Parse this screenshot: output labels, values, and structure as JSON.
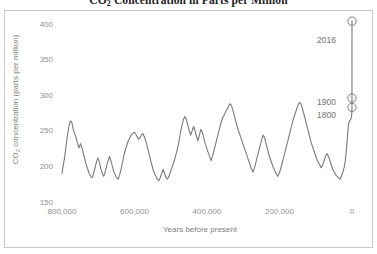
{
  "chart_data": {
    "type": "line",
    "title": "CO2 Concentration in Parts per Million",
    "title_main": "CO",
    "title_sub": "2",
    "title_rest": " Concentration in Parts per Million",
    "xlabel": "Years before present",
    "ylabel_main": "CO",
    "ylabel_sub": "2",
    "ylabel_rest": " concentration (parts per million)",
    "ylabel": "CO2 concentration (parts per million)",
    "xlim": [
      800000,
      0
    ],
    "ylim": [
      150,
      400
    ],
    "x_ticks": [
      "800,000",
      "600,000",
      "400,000",
      "200,000",
      "0"
    ],
    "x_tick_values": [
      800000,
      600000,
      400000,
      200000,
      0
    ],
    "y_ticks": [
      "150",
      "200",
      "250",
      "300",
      "350",
      "400"
    ],
    "y_tick_values": [
      150,
      200,
      250,
      300,
      350,
      400
    ],
    "grid": false,
    "legend": "none",
    "line_color": "#7a7a7a",
    "series": [
      {
        "name": "Ice core CO2 record",
        "x": [
          800000,
          797000,
          793000,
          789000,
          785000,
          781000,
          777000,
          773000,
          769000,
          765000,
          761000,
          757000,
          753000,
          749000,
          745000,
          741000,
          737000,
          733000,
          729000,
          725000,
          721000,
          717000,
          713000,
          709000,
          705000,
          701000,
          697000,
          693000,
          689000,
          685000,
          681000,
          677000,
          673000,
          669000,
          665000,
          661000,
          657000,
          653000,
          649000,
          645000,
          641000,
          637000,
          633000,
          629000,
          625000,
          621000,
          617000,
          613000,
          609000,
          605000,
          601000,
          597000,
          593000,
          589000,
          585000,
          581000,
          577000,
          573000,
          569000,
          565000,
          561000,
          557000,
          553000,
          549000,
          545000,
          541000,
          537000,
          533000,
          529000,
          525000,
          521000,
          517000,
          513000,
          509000,
          505000,
          501000,
          497000,
          493000,
          489000,
          485000,
          481000,
          477000,
          473000,
          469000,
          465000,
          461000,
          457000,
          453000,
          449000,
          445000,
          441000,
          437000,
          433000,
          429000,
          425000,
          421000,
          417000,
          413000,
          409000,
          405000,
          401000,
          397000,
          393000,
          389000,
          385000,
          381000,
          377000,
          373000,
          369000,
          365000,
          361000,
          357000,
          353000,
          349000,
          345000,
          341000,
          337000,
          333000,
          329000,
          325000,
          321000,
          317000,
          313000,
          309000,
          305000,
          301000,
          297000,
          293000,
          289000,
          285000,
          281000,
          277000,
          273000,
          269000,
          265000,
          261000,
          257000,
          253000,
          249000,
          245000,
          241000,
          237000,
          233000,
          229000,
          225000,
          221000,
          217000,
          213000,
          209000,
          205000,
          201000,
          197000,
          193000,
          189000,
          185000,
          181000,
          177000,
          173000,
          169000,
          165000,
          161000,
          157000,
          153000,
          149000,
          145000,
          141000,
          137000,
          133000,
          129000,
          125000,
          121000,
          117000,
          113000,
          109000,
          105000,
          101000,
          97000,
          93000,
          89000,
          85000,
          81000,
          77000,
          73000,
          69000,
          65000,
          61000,
          57000,
          53000,
          49000,
          45000,
          41000,
          37000,
          33000,
          29000,
          25000,
          21000,
          18000,
          16000,
          14000,
          12000,
          11000,
          10000,
          8000,
          6000,
          4000,
          2000,
          1000,
          500,
          216,
          116,
          0
        ],
        "y": [
          190,
          200,
          212,
          228,
          244,
          256,
          264,
          262,
          252,
          246,
          240,
          232,
          226,
          232,
          226,
          218,
          210,
          202,
          196,
          190,
          186,
          184,
          190,
          198,
          206,
          212,
          206,
          198,
          190,
          186,
          192,
          200,
          208,
          214,
          208,
          200,
          192,
          188,
          184,
          182,
          188,
          196,
          206,
          216,
          224,
          230,
          236,
          240,
          244,
          246,
          248,
          246,
          242,
          238,
          240,
          244,
          246,
          242,
          236,
          228,
          220,
          212,
          204,
          196,
          190,
          186,
          182,
          180,
          184,
          190,
          196,
          190,
          184,
          182,
          186,
          192,
          198,
          204,
          210,
          218,
          226,
          236,
          248,
          258,
          266,
          270,
          266,
          258,
          250,
          244,
          250,
          256,
          250,
          242,
          236,
          244,
          252,
          248,
          240,
          232,
          226,
          220,
          214,
          208,
          214,
          222,
          230,
          238,
          246,
          254,
          262,
          268,
          272,
          276,
          280,
          284,
          288,
          286,
          280,
          272,
          264,
          256,
          250,
          244,
          238,
          232,
          226,
          220,
          214,
          208,
          202,
          196,
          192,
          198,
          206,
          214,
          222,
          230,
          238,
          244,
          240,
          232,
          224,
          216,
          210,
          204,
          198,
          194,
          190,
          186,
          190,
          196,
          204,
          212,
          220,
          228,
          236,
          244,
          252,
          260,
          268,
          274,
          280,
          286,
          290,
          288,
          282,
          274,
          266,
          258,
          250,
          242,
          234,
          228,
          222,
          216,
          210,
          206,
          202,
          198,
          202,
          208,
          214,
          218,
          214,
          208,
          202,
          196,
          192,
          188,
          186,
          184,
          182,
          186,
          192,
          200,
          210,
          220,
          232,
          244,
          252,
          258,
          262,
          264,
          266,
          268,
          272,
          276,
          280,
          285,
          404
        ]
      }
    ],
    "annotations": [
      {
        "id": "2016",
        "label": "2016",
        "x": 0,
        "y": 404,
        "marker": "circle"
      },
      {
        "id": "1900",
        "label": "1900",
        "x": 116,
        "y": 296,
        "marker": "circle"
      },
      {
        "id": "1800",
        "label": "1800",
        "x": 216,
        "y": 283,
        "marker": "circle"
      }
    ]
  }
}
